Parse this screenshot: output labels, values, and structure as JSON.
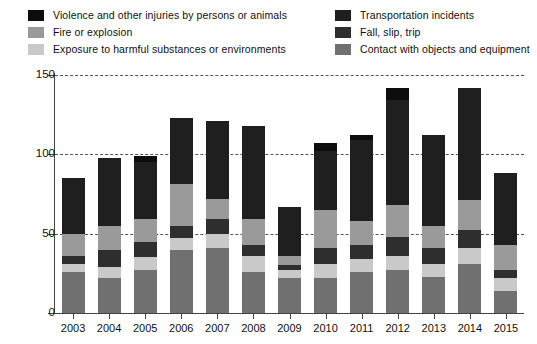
{
  "legend": {
    "left_column": [
      {
        "label": "Violence and other injuries by persons or animals",
        "key": "violence",
        "color": "#0d0d0d"
      },
      {
        "label": "Fire or explosion",
        "key": "fire",
        "color": "#9a9a9a"
      },
      {
        "label": "Exposure to harmful substances or environments",
        "key": "exposure",
        "color": "#c9c9c9"
      }
    ],
    "right_column": [
      {
        "label": "Transportation incidents",
        "key": "transportation",
        "color": "#1f1f1f"
      },
      {
        "label": "Fall, slip, trip",
        "key": "fall",
        "color": "#2e2e2e"
      },
      {
        "label": "Contact with objects and equipment",
        "key": "contact",
        "color": "#707070"
      }
    ]
  },
  "chart_data": {
    "type": "bar",
    "subtype": "stacked",
    "title": "",
    "subtitle": "",
    "xlabel": "",
    "ylabel": "",
    "ylim": [
      0,
      150
    ],
    "y_ticks": [
      0,
      50,
      100,
      150
    ],
    "y_tick_labels": [
      "0",
      "50",
      "100",
      "150"
    ],
    "grid": true,
    "grid_axis": "y",
    "grid_style": "dashed",
    "legend_position": "top",
    "categories": [
      "2003",
      "2004",
      "2005",
      "2006",
      "2007",
      "2008",
      "2009",
      "2010",
      "2011",
      "2012",
      "2013",
      "2014",
      "2015"
    ],
    "series": [
      {
        "name": "Contact with objects and equipment",
        "key": "contact",
        "color": "#707070",
        "stack_order": 1,
        "values": [
          26,
          22,
          27,
          40,
          41,
          26,
          22,
          22,
          26,
          27,
          23,
          31,
          14
        ]
      },
      {
        "name": "Exposure to harmful substances or environments",
        "key": "exposure",
        "color": "#c9c9c9",
        "stack_order": 2,
        "values": [
          5,
          7,
          8,
          7,
          9,
          10,
          5,
          9,
          8,
          9,
          8,
          10,
          8
        ]
      },
      {
        "name": "Fall, slip, trip",
        "key": "fall",
        "color": "#2e2e2e",
        "stack_order": 3,
        "values": [
          5,
          11,
          10,
          8,
          9,
          7,
          3,
          10,
          9,
          12,
          10,
          11,
          5
        ]
      },
      {
        "name": "Fire or explosion",
        "key": "fire",
        "color": "#9a9a9a",
        "stack_order": 4,
        "values": [
          14,
          15,
          14,
          26,
          13,
          16,
          6,
          24,
          15,
          20,
          14,
          19,
          16
        ]
      },
      {
        "name": "Transportation incidents",
        "key": "transportation",
        "color": "#1f1f1f",
        "stack_order": 5,
        "values": [
          35,
          43,
          36,
          42,
          49,
          59,
          31,
          37,
          51,
          66,
          57,
          71,
          45
        ]
      },
      {
        "name": "Violence and other injuries by persons or animals",
        "key": "violence",
        "color": "#0d0d0d",
        "stack_order": 6,
        "values": [
          0,
          0,
          4,
          0,
          0,
          0,
          0,
          5,
          3,
          8,
          0,
          0,
          0
        ]
      }
    ],
    "totals": [
      85,
      98,
      99,
      123,
      121,
      118,
      67,
      107,
      112,
      142,
      112,
      142,
      88
    ]
  }
}
